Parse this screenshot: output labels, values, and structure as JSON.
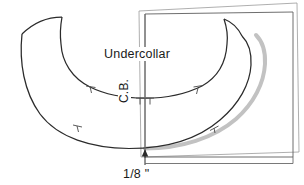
{
  "document": {
    "kind": "sewing-pattern-technical-drawing",
    "title": "Undercollar"
  },
  "labels": {
    "undercollar": "Undercollar",
    "center_back": "C.B.",
    "measurement": "1/8 \""
  },
  "colors": {
    "outline": "#262626",
    "offset_line": "#b4b4b4",
    "frame": "#6e6e6e",
    "frame_back": "#9a9a9a",
    "text": "#1a1a1a",
    "background": "#ffffff"
  },
  "annotations": {
    "center_back_line": "vertical center back guide line",
    "offset_amount": "1/8 \"",
    "arrow_direction": "up",
    "notch_count": 5,
    "notches": [
      {
        "name": "notch-upper-left",
        "position": "upper curve left"
      },
      {
        "name": "notch-center-back-pair",
        "position": "upper curve center back"
      },
      {
        "name": "notch-upper-right",
        "position": "upper curve right"
      },
      {
        "name": "notch-lower-left",
        "position": "lower curve left"
      },
      {
        "name": "notch-lower-right",
        "position": "lower curve right"
      }
    ]
  },
  "shapes": {
    "collar_piece": "crescent / banana shaped undercollar pattern piece",
    "paper_frame_front": "front sheet rectangle",
    "paper_frame_back": "back sheet rectangle slightly rotated"
  }
}
